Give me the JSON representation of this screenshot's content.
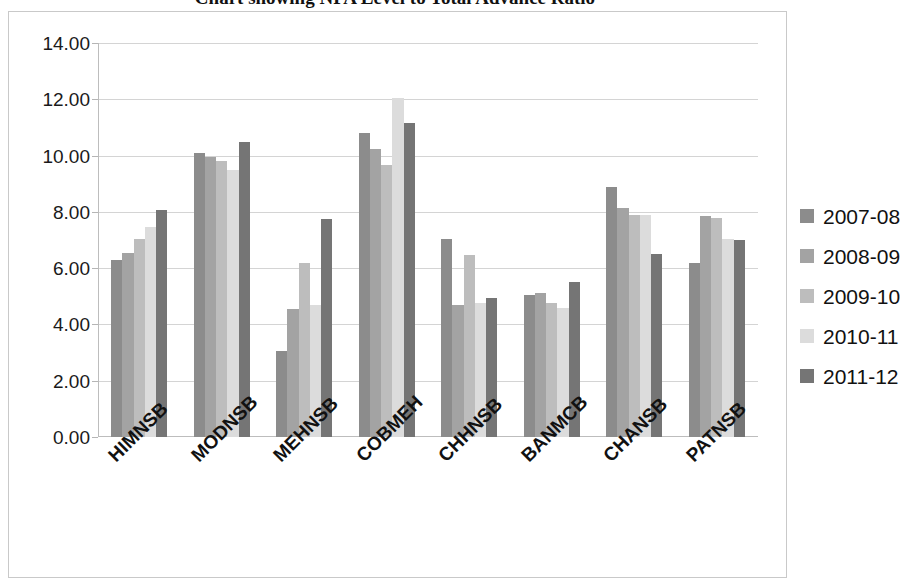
{
  "chart_data": {
    "type": "bar",
    "title": "Chart showing NPA Level to Total Advance Ratio",
    "xlabel": "",
    "ylabel": "",
    "ylim": [
      0,
      14
    ],
    "ytick_step": 2,
    "grid": true,
    "legend_position": "right",
    "categories": [
      "HIMNSB",
      "MODNSB",
      "MEHNSB",
      "COBMEH",
      "CHHNSB",
      "BANMCB",
      "CHANSB",
      "PATNSB"
    ],
    "ytick_labels": [
      "14.00",
      "12.00",
      "10.00",
      "8.00",
      "6.00",
      "4.00",
      "2.00",
      "0.00"
    ],
    "ytick_values": [
      14,
      12,
      10,
      8,
      6,
      4,
      2,
      0
    ],
    "series": [
      {
        "name": "2007-08",
        "color": "#8c8c8c",
        "values": [
          6.3,
          10.1,
          3.05,
          10.8,
          7.05,
          5.05,
          8.9,
          6.2
        ]
      },
      {
        "name": "2008-09",
        "color": "#a3a3a3",
        "values": [
          6.55,
          9.95,
          4.55,
          10.25,
          4.7,
          5.1,
          8.15,
          7.85
        ]
      },
      {
        "name": "2009-10",
        "color": "#bdbdbd",
        "values": [
          7.05,
          9.8,
          6.2,
          9.65,
          6.45,
          4.75,
          7.9,
          7.8
        ]
      },
      {
        "name": "2010-11",
        "color": "#dcdcdc",
        "values": [
          7.45,
          9.5,
          4.7,
          12.05,
          4.75,
          4.6,
          7.9,
          7.05
        ]
      },
      {
        "name": "2011-12",
        "color": "#757575",
        "values": [
          8.05,
          10.5,
          7.75,
          11.15,
          4.95,
          5.5,
          6.5,
          7.0
        ]
      }
    ]
  },
  "legend": {
    "items": [
      {
        "label": "2007-08"
      },
      {
        "label": "2008-09"
      },
      {
        "label": "2009-10"
      },
      {
        "label": "2010-11"
      },
      {
        "label": "2011-12"
      }
    ]
  }
}
